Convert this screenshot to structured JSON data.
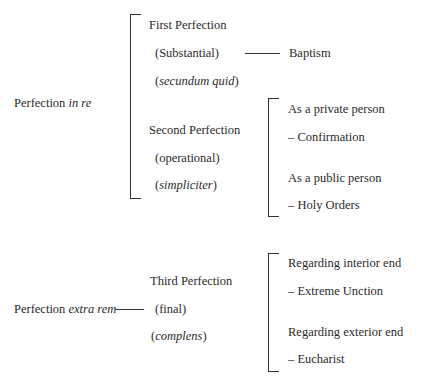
{
  "diagram": {
    "in_re": {
      "label_prefix": "Perfection ",
      "label_italic": "in re",
      "first": {
        "title": "First Perfection",
        "type": "(Substantial)",
        "latin_open": "(",
        "latin": "secundum quid",
        "latin_close": ")",
        "sacrament": "Baptism"
      },
      "second": {
        "title": "Second Perfection",
        "type": "(operational)",
        "latin_open": "(",
        "latin": "simpliciter",
        "latin_close": ")",
        "branches": [
          {
            "label": "As a private person",
            "sacrament": "– Confirmation"
          },
          {
            "label": "As a public person",
            "sacrament": "– Holy Orders"
          }
        ]
      }
    },
    "extra_rem": {
      "label_prefix": "Perfection ",
      "label_italic": "extra rem",
      "third": {
        "title": "Third Perfection",
        "type": "(final)",
        "latin_open": "(",
        "latin": "complens",
        "latin_close": ")",
        "branches": [
          {
            "label": "Regarding interior end",
            "sacrament": "– Extreme Unction"
          },
          {
            "label": "Regarding exterior end",
            "sacrament": "– Eucharist"
          }
        ]
      }
    }
  }
}
